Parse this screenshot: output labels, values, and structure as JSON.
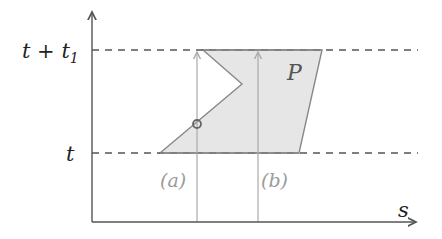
{
  "diagram": {
    "axes": {
      "y_axis": {
        "x": 92,
        "top": 10,
        "bottom": 222
      },
      "x_axis": {
        "y": 222,
        "left": 92,
        "right": 418,
        "label": "s"
      }
    },
    "levels": [
      {
        "id": "top",
        "y": 50,
        "label_main": "t + t",
        "label_sub": "1"
      },
      {
        "id": "bottom",
        "y": 153,
        "label_main": "t",
        "label_sub": ""
      }
    ],
    "region": {
      "label": "P",
      "fill": "#e6e6e6",
      "stroke": "#888888",
      "points": [
        [
          160,
          153
        ],
        [
          242,
          84
        ],
        [
          203,
          50
        ],
        [
          322,
          50
        ],
        [
          299,
          153
        ]
      ]
    },
    "paths": [
      {
        "id": "a",
        "label": "(a)",
        "x": 197
      },
      {
        "id": "b",
        "label": "(b)",
        "x": 258
      }
    ],
    "marker": {
      "x": 197,
      "y": 124,
      "r": 4
    },
    "colors": {
      "axis": "#555555",
      "dash": "#555555",
      "path_line": "#aaaaaa",
      "path_label": "#9a9a9a",
      "text": "#222222"
    }
  }
}
